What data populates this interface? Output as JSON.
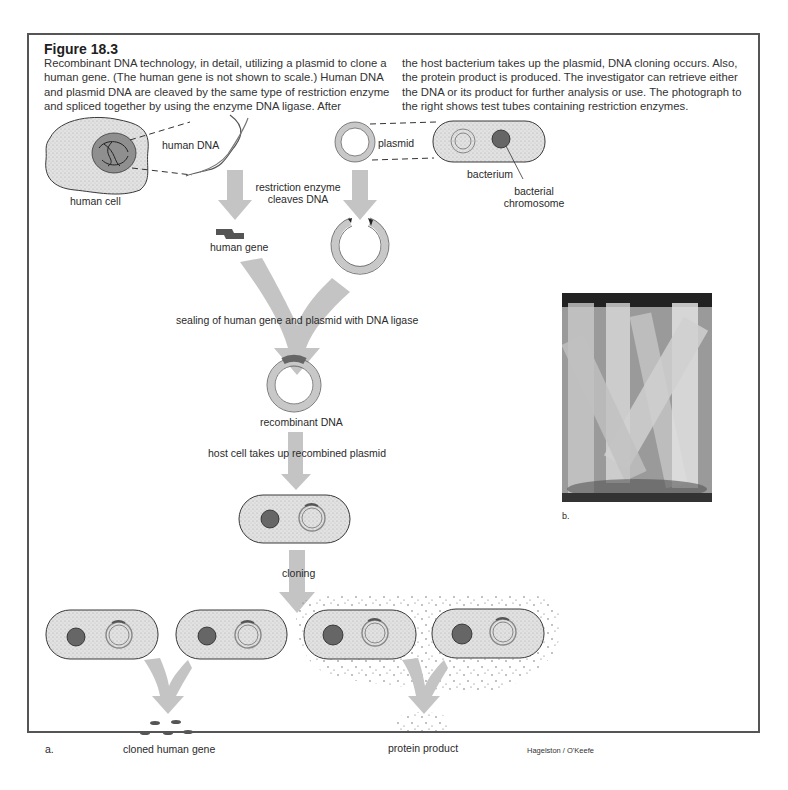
{
  "figure": {
    "title": "Figure 18.3",
    "caption_left": "Recombinant DNA technology, in detail, utilizing a plasmid to clone a human gene. (The human gene is not shown to scale.) Human DNA and plasmid DNA are cleaved by the same type of restriction enzyme and spliced together by using the enzyme DNA ligase. After",
    "caption_right": "the host bacterium takes up the plasmid, DNA cloning occurs. Also, the protein product is produced. The investigator can retrieve either the DNA or its product for further analysis or use. The photograph to the right shows test tubes containing restriction enzymes."
  },
  "labels": {
    "human_cell": "human cell",
    "human_dna": "human DNA",
    "plasmid": "plasmid",
    "bacterium": "bacterium",
    "bacterial_chromosome_1": "bacterial",
    "bacterial_chromosome_2": "chromosome",
    "restriction_1": "restriction enzyme",
    "restriction_2": "cleaves DNA",
    "human_gene": "human gene",
    "sealing": "sealing of human gene and plasmid with DNA ligase",
    "recombinant_dna": "recombinant DNA",
    "host_cell": "host cell takes up recombined plasmid",
    "cloning": "cloning",
    "cloned_human_gene": "cloned human gene",
    "protein_product": "protein product",
    "panel_a": "a.",
    "panel_b": "b.",
    "credit": "Hagelston / O'Keefe"
  },
  "colors": {
    "arrow": "#c4c4c4",
    "cell_fill": "#dedede",
    "nucleus": "#8f8f8f",
    "ring": "#c8c8c8",
    "outline": "#3a3a3a",
    "gene": "#555555"
  },
  "photo": {
    "description": "test tubes containing restriction enzymes"
  }
}
